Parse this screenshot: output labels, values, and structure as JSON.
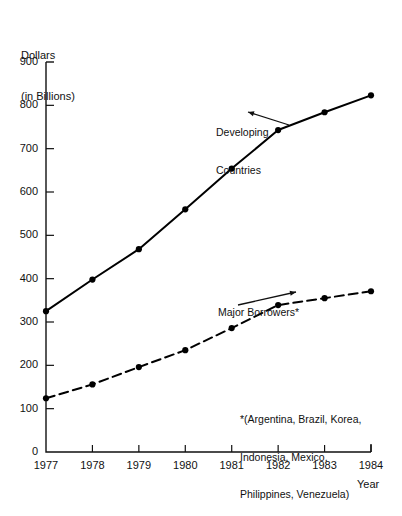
{
  "chart_data": {
    "type": "line",
    "title": "",
    "ylabel_line1": "Dollars",
    "ylabel_line2": "(in Billions)",
    "xlabel": "Year",
    "x": [
      1977,
      1978,
      1979,
      1980,
      1981,
      1982,
      1983,
      1984
    ],
    "categories": [
      "1977",
      "1978",
      "1979",
      "1980",
      "1981",
      "1982",
      "1983",
      "1984"
    ],
    "xlim": [
      1977,
      1984
    ],
    "ylim": [
      0,
      900
    ],
    "yticks": [
      0,
      100,
      200,
      300,
      400,
      500,
      600,
      700,
      800,
      900
    ],
    "ytick_labels": [
      "0",
      "100",
      "200",
      "300",
      "400",
      "500",
      "600",
      "700",
      "800",
      "900"
    ],
    "grid": false,
    "legend_position": "inline-annotations",
    "series": [
      {
        "name": "Developing Countries",
        "label_line1": "Developing",
        "label_line2": "Countries",
        "linestyle": "solid",
        "marker": "filled-circle",
        "color": "#000000",
        "values": [
          325,
          398,
          468,
          560,
          654,
          743,
          784,
          823
        ]
      },
      {
        "name": "Major Borrowers*",
        "label_line1": "Major Borrowers*",
        "label_line2": "",
        "linestyle": "dashed",
        "marker": "filled-circle",
        "color": "#000000",
        "values": [
          124,
          156,
          196,
          235,
          286,
          339,
          355,
          371
        ]
      }
    ],
    "annotations": {
      "footnote_line1": "*(Argentina, Brazil, Korea,",
      "footnote_line2": "Indonesia, Mexico,",
      "footnote_line3": "Philippines, Venezuela)"
    }
  },
  "colors": {
    "ink": "#111111",
    "line": "#000000",
    "background": "#ffffff"
  }
}
